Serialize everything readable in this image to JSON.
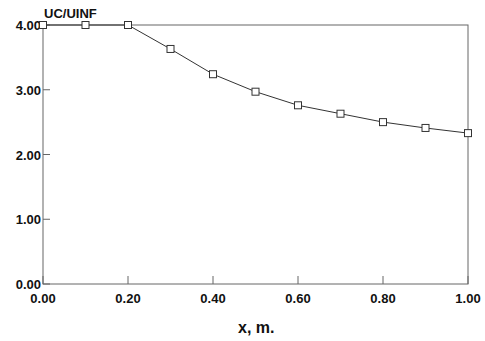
{
  "chart_data": {
    "type": "line",
    "title": "",
    "xlabel": "x, m.",
    "ylabel": "UC/UINF",
    "xlim": [
      0.0,
      1.0
    ],
    "ylim": [
      0.0,
      4.0
    ],
    "grid": false,
    "legend": null,
    "x_ticks": [
      "0.00",
      "0.20",
      "0.40",
      "0.60",
      "0.80",
      "1.00"
    ],
    "y_ticks": [
      "0.00",
      "1.00",
      "2.00",
      "3.00",
      "4.00"
    ],
    "marker": "open-square",
    "series": [
      {
        "name": "UC/UINF",
        "x": [
          0.0,
          0.1,
          0.2,
          0.3,
          0.4,
          0.5,
          0.6,
          0.7,
          0.8,
          0.9,
          1.0
        ],
        "values": [
          4.0,
          4.0,
          4.0,
          3.63,
          3.24,
          2.97,
          2.76,
          2.63,
          2.5,
          2.41,
          2.33
        ]
      }
    ]
  },
  "colors": {
    "line": "#333333",
    "axis": "#555555",
    "text": "#111111"
  }
}
